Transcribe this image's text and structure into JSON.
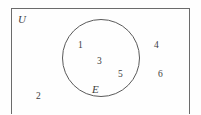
{
  "diagram": {
    "type": "venn-diagram",
    "title": "",
    "universe": {
      "label": "U",
      "description": "universal set rectangle"
    },
    "sets": [
      {
        "label": "E",
        "shape": "circle",
        "description": "set E drawn as a circle inside the universal set"
      }
    ],
    "elements": {
      "inside_circle": [
        {
          "value": "1"
        },
        {
          "value": "3"
        },
        {
          "value": "5"
        }
      ],
      "outside_circle": [
        {
          "value": "2"
        },
        {
          "value": "4"
        },
        {
          "value": "6"
        }
      ]
    },
    "colors": {
      "background": "#fefefe",
      "rect_stroke": "#6b6b6b",
      "circle_stroke": "#5a5a5a",
      "text": "#3d3d3d"
    }
  }
}
